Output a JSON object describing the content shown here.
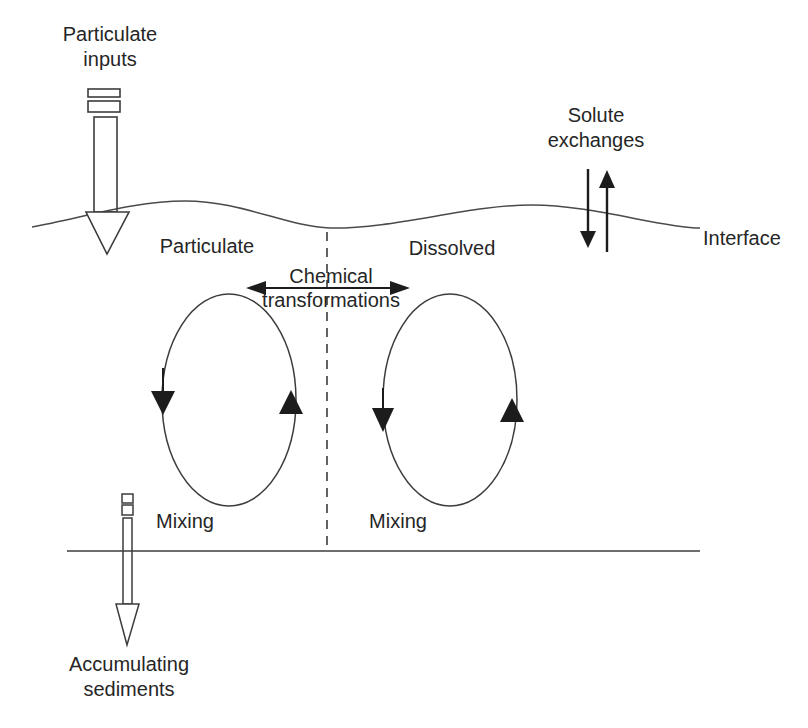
{
  "labels": {
    "particulate_inputs": {
      "line1": "Particulate",
      "line2": "inputs"
    },
    "solute_exchanges": {
      "line1": "Solute",
      "line2": "exchanges"
    },
    "interface": "Interface",
    "particulate": "Particulate",
    "dissolved": "Dissolved",
    "chemical_transformations": {
      "line1": "Chemical",
      "line2": "transformations"
    },
    "mixing_left": "Mixing",
    "mixing_right": "Mixing",
    "accumulating_sediments": {
      "line1": "Accumulating",
      "line2": "sediments"
    }
  },
  "colors": {
    "line": "#4a4a4a",
    "text": "#262626",
    "arrow_fill": "#1c1c1c",
    "background": "#ffffff"
  }
}
